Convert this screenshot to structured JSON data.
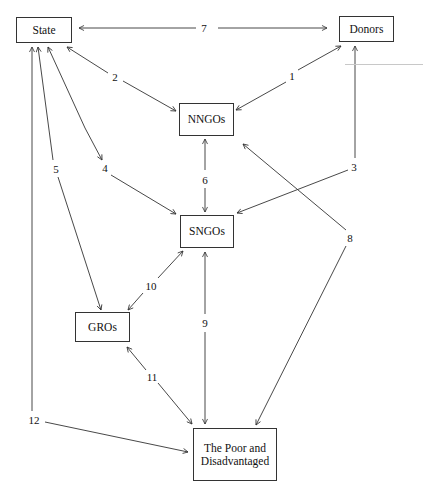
{
  "diagram": {
    "nodes": {
      "state": {
        "label": "State"
      },
      "donors": {
        "label": "Donors"
      },
      "nngos": {
        "label": "NNGOs"
      },
      "sngos": {
        "label": "SNGOs"
      },
      "gros": {
        "label": "GROs"
      },
      "poor": {
        "label": "The Poor and Disadvantaged"
      }
    },
    "edges": [
      {
        "id": "1",
        "label": "1",
        "from": "NNGOs",
        "to": "Donors",
        "direction": "bidirectional"
      },
      {
        "id": "2",
        "label": "2",
        "from": "State",
        "to": "NNGOs",
        "direction": "bidirectional"
      },
      {
        "id": "3",
        "label": "3",
        "from": "Donors",
        "to": "SNGOs",
        "direction": "bidirectional"
      },
      {
        "id": "4",
        "label": "4",
        "from": "State",
        "to": "SNGOs",
        "direction": "bidirectional"
      },
      {
        "id": "5",
        "label": "5",
        "from": "State",
        "to": "GROs",
        "direction": "bidirectional"
      },
      {
        "id": "6",
        "label": "6",
        "from": "NNGOs",
        "to": "SNGOs",
        "direction": "bidirectional"
      },
      {
        "id": "7",
        "label": "7",
        "from": "State",
        "to": "Donors",
        "direction": "bidirectional"
      },
      {
        "id": "8",
        "label": "8",
        "from": "NNGOs",
        "to": "The Poor and Disadvantaged",
        "direction": "bidirectional"
      },
      {
        "id": "9",
        "label": "9",
        "from": "SNGOs",
        "to": "The Poor and Disadvantaged",
        "direction": "bidirectional"
      },
      {
        "id": "10",
        "label": "10",
        "from": "GROs",
        "to": "SNGOs",
        "direction": "bidirectional"
      },
      {
        "id": "11",
        "label": "11",
        "from": "GROs",
        "to": "The Poor and Disadvantaged",
        "direction": "bidirectional"
      },
      {
        "id": "12",
        "label": "12",
        "from": "State",
        "to": "The Poor and Disadvantaged",
        "direction": "bidirectional"
      }
    ],
    "colors": {
      "stroke": "#333333",
      "background": "#ffffff"
    }
  }
}
